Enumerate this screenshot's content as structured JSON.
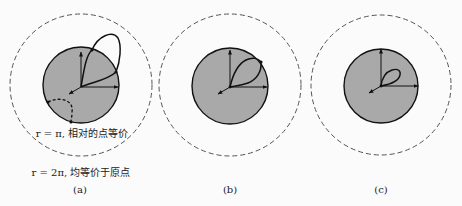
{
  "colors": {
    "background": "#fbfbfb",
    "sphere_fill": "#a9a9a9",
    "stroke": "#111111",
    "dashed": "#555555"
  },
  "panels": [
    {
      "id": "a",
      "caption": "(a)",
      "annotations": {
        "inner": "r = π, 相对的点等价",
        "outer": "r = 2π, 均等价于原点"
      }
    },
    {
      "id": "b",
      "caption": "(b)"
    },
    {
      "id": "c",
      "caption": "(c)"
    }
  ]
}
